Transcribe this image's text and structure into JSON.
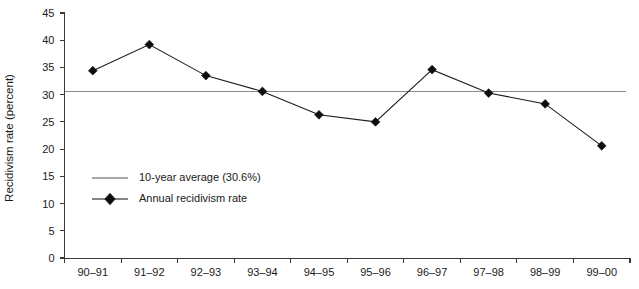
{
  "chart_data": {
    "type": "line",
    "title": "",
    "xlabel": "",
    "ylabel": "Recidivism rate (percent)",
    "categories": [
      "90–91",
      "91–92",
      "92–93",
      "93–94",
      "94–95",
      "95–96",
      "96–97",
      "97–98",
      "98–99",
      "99–00"
    ],
    "ylim": [
      0,
      45
    ],
    "yticks": [
      0,
      5,
      10,
      15,
      20,
      25,
      30,
      35,
      40,
      45
    ],
    "ytick_labels": [
      "0",
      "5",
      "10",
      "15",
      "20",
      "25",
      "30",
      "35",
      "40",
      "45"
    ],
    "grid": false,
    "legend_position": "inside-left",
    "series": [
      {
        "name": "Annual recidivism rate",
        "type": "line-marker",
        "marker": "diamond",
        "color": "#0d0d0d",
        "values": [
          34.4,
          39.2,
          33.5,
          30.6,
          26.3,
          25.0,
          34.6,
          30.3,
          28.3,
          20.6
        ]
      },
      {
        "name": "10-year average (30.6%)",
        "type": "reference-line",
        "color": "#8a8a8a",
        "value": 30.6
      }
    ],
    "annotations": []
  },
  "legend": {
    "entries": [
      {
        "label": "10-year average (30.6%)",
        "marker": "line",
        "color": "#8a8a8a"
      },
      {
        "label": "Annual recidivism rate",
        "marker": "line-diamond",
        "color": "#0d0d0d"
      }
    ]
  },
  "colors": {
    "series_line": "#0d0d0d",
    "average_line": "#8a8a8a",
    "axis": "#3a3a3a",
    "text": "#1a1a1a",
    "background": "#ffffff"
  }
}
